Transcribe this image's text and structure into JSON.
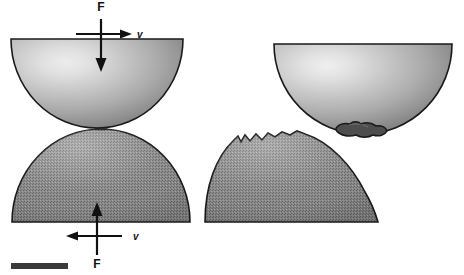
{
  "figure": {
    "background_color": "#ffffff",
    "panels": [
      {
        "id": "left-panel",
        "name": "before-contact-separation",
        "description": "Two hemispheres approaching in point contact under load F with relative sliding velocity v"
      },
      {
        "id": "right-panel",
        "name": "after-material-transfer",
        "description": "Upper hemisphere has pulled away carrying an adhered fragment; lower hemisphere shows a jagged chipped crater"
      }
    ]
  },
  "labels": {
    "force_upper": "F",
    "velocity_upper": "v",
    "force_lower": "F",
    "velocity_lower": "v"
  },
  "colors": {
    "outline": "#1a1a1a",
    "upper_body_light": "#e2e2e2",
    "upper_body_mid": "#b4b4b4",
    "upper_body_dark": "#6f6f6f",
    "lower_body_light": "#9a9a9a",
    "lower_body_mid": "#8a8a8a",
    "lower_body_dark": "#6e6e6e",
    "debris": "#4a4a4a",
    "scale_bar": "#3a3a3a",
    "arrow": "#111111"
  },
  "scale_bar": {
    "name": "scale-bar",
    "label": "",
    "x": 11,
    "y": 263,
    "width": 57,
    "height": 6
  },
  "geometry": {
    "left_upper_dome": {
      "cx": 97,
      "cy": 39,
      "rx": 86,
      "ry": 89
    },
    "left_lower_dome": {
      "cx": 101,
      "cy": 222,
      "rx": 89,
      "ry": 93
    },
    "right_upper_dome": {
      "cx": 363,
      "cy": 44,
      "rx": 89,
      "ry": 90
    },
    "right_lower_dome": {
      "cx": 291,
      "cy": 222,
      "rx": 87,
      "ry": 90
    }
  }
}
